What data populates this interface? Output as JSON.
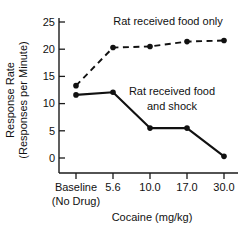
{
  "chart_data": {
    "type": "line",
    "title": "",
    "xlabel": "Cocaine (mg/kg)",
    "ylabel": "Response Rate\n(Responses per Minute)",
    "ylabel_line1": "Response Rate",
    "ylabel_line2": "(Responses per Minute)",
    "categories": [
      "Baseline\n(No Drug)",
      "5.6",
      "10.0",
      "17.0",
      "30.0"
    ],
    "xtick_labels": [
      {
        "line1": "Baseline",
        "line2": "(No Drug)"
      },
      {
        "line1": "5.6",
        "line2": ""
      },
      {
        "line1": "10.0",
        "line2": ""
      },
      {
        "line1": "17.0",
        "line2": ""
      },
      {
        "line1": "30.0",
        "line2": ""
      }
    ],
    "ytick_labels": [
      "0",
      "5",
      "10",
      "15",
      "20",
      "25"
    ],
    "ytick_values": [
      0,
      5,
      10,
      15,
      20,
      25
    ],
    "ylim": [
      0,
      26
    ],
    "grid": false,
    "legend_position": "inline-annotation",
    "series": [
      {
        "name": "Rat received food only",
        "style": "dashed",
        "marker": "filled-circle",
        "color": "#111111",
        "values": [
          13.3,
          20.3,
          20.5,
          21.4,
          21.6
        ]
      },
      {
        "name": "Rat received food and shock",
        "style": "solid",
        "marker": "filled-circle",
        "color": "#111111",
        "values": [
          11.6,
          12.1,
          5.5,
          5.5,
          0.3
        ]
      }
    ],
    "annotations": [
      {
        "text": "Rat received food only",
        "for_series": "Rat received food only"
      },
      {
        "text_line1": "Rat received food",
        "text_line2": "and shock",
        "for_series": "Rat received food and shock"
      }
    ]
  },
  "colors": {
    "axis": "#111111",
    "series_primary": "#111111",
    "background": "#ffffff"
  }
}
